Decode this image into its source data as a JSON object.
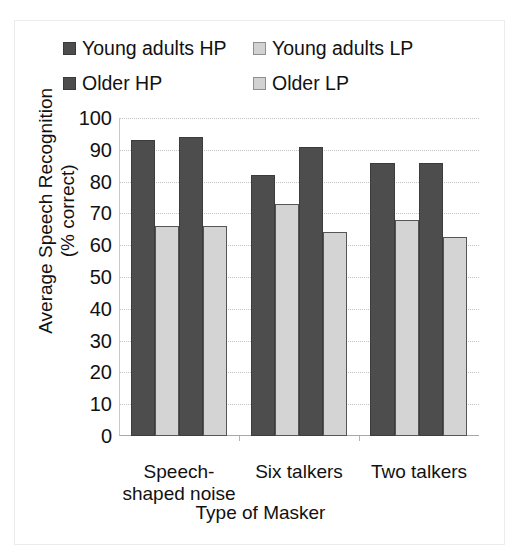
{
  "chart_data": {
    "type": "bar",
    "title": "",
    "xlabel": "Type of Masker",
    "ylabel": "Average Speech Recognition (% correct)",
    "ylabel_line1": "Average Speech Recognition",
    "ylabel_line2": "(% correct)",
    "categories": [
      "Speech-shaped noise",
      "Six talkers",
      "Two talkers"
    ],
    "category_lines": [
      [
        "Speech-",
        "shaped noise"
      ],
      [
        "Six talkers"
      ],
      [
        "Two talkers"
      ]
    ],
    "series": [
      {
        "name": "Young adults HP",
        "color": "#4d4d4d",
        "values": [
          93,
          82,
          86
        ]
      },
      {
        "name": "Young adults LP",
        "color": "#d4d4d4",
        "values": [
          66,
          73,
          68
        ]
      },
      {
        "name": "Older HP",
        "color": "#4d4d4d",
        "values": [
          94,
          91,
          86
        ]
      },
      {
        "name": "Older LP",
        "color": "#d4d4d4",
        "values": [
          66,
          64,
          62.5
        ]
      }
    ],
    "ylim": [
      0,
      100
    ],
    "yticks": [
      100,
      90,
      80,
      70,
      60,
      50,
      40,
      30,
      20,
      10,
      0
    ],
    "grid": true,
    "legend_position": "top"
  },
  "legend": {
    "rows": [
      [
        {
          "label": "Young adults HP",
          "swatch": "dark"
        },
        {
          "label": "Young adults LP",
          "swatch": "light"
        }
      ],
      [
        {
          "label": "Older HP",
          "swatch": "dark"
        },
        {
          "label": "Older LP",
          "swatch": "light"
        }
      ]
    ]
  }
}
